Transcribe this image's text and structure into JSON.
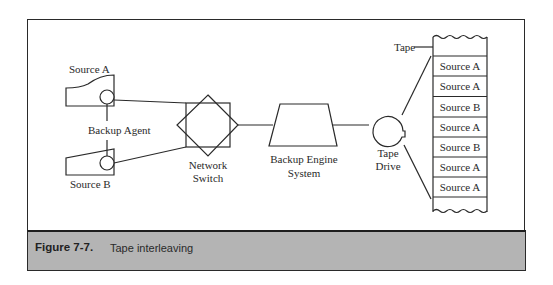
{
  "figure": {
    "label": "Figure 7-7.",
    "title": "Tape interleaving"
  },
  "diagram": {
    "nodes": {
      "source_a": "Source A",
      "source_b": "Source B",
      "backup_agent": "Backup Agent",
      "network_switch_line1": "Network",
      "network_switch_line2": "Switch",
      "backup_engine_line1": "Backup Engine",
      "backup_engine_line2": "System",
      "tape_drive_line1": "Tape",
      "tape_drive_line2": "Drive",
      "tape_label": "Tape"
    },
    "tape_blocks": [
      "Source A",
      "Source A",
      "Source B",
      "Source A",
      "Source B",
      "Source A",
      "Source A"
    ],
    "colors": {
      "line": "#2a2a2a",
      "caption_bg": "#b4b4b4"
    }
  }
}
